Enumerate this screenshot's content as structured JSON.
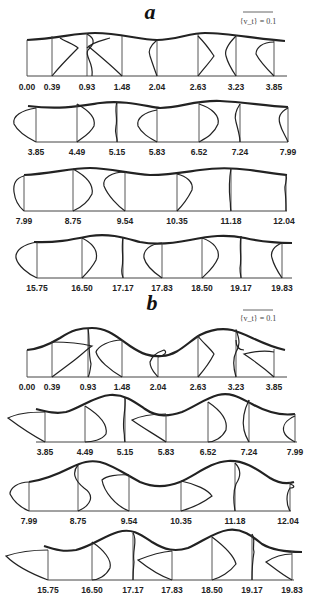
{
  "figure": {
    "panels": [
      {
        "label": "a",
        "scale_bar": "{v_t} = 0.1",
        "rows": [
          {
            "ticks": [
              "0.00",
              "0.39",
              "0.93",
              "1.48",
              "2.04",
              "2.63",
              "3.23",
              "3.85"
            ]
          },
          {
            "ticks": [
              "3.85",
              "4.49",
              "5.15",
              "5.83",
              "6.52",
              "7.24",
              "7.99"
            ]
          },
          {
            "ticks": [
              "7.99",
              "8.75",
              "9.54",
              "10.35",
              "11.18",
              "12.04"
            ]
          },
          {
            "ticks": [
              "15.75",
              "16.50",
              "17.17",
              "17.83",
              "18.50",
              "19.17",
              "19.83"
            ]
          }
        ]
      },
      {
        "label": "b",
        "scale_bar": "{v_t} = 0.1",
        "rows": [
          {
            "ticks": [
              "0.00",
              "0.39",
              "0.93",
              "1.48",
              "2.04",
              "2.63",
              "3.23",
              "3.85"
            ]
          },
          {
            "ticks": [
              "3.85",
              "4.49",
              "5.15",
              "5.83",
              "6.52",
              "7.24",
              "7.99"
            ]
          },
          {
            "ticks": [
              "7.99",
              "8.75",
              "9.54",
              "10.35",
              "11.18",
              "12.04"
            ]
          },
          {
            "ticks": [
              "15.75",
              "16.50",
              "17.17",
              "17.83",
              "18.50",
              "19.17",
              "19.83"
            ]
          }
        ]
      }
    ]
  }
}
